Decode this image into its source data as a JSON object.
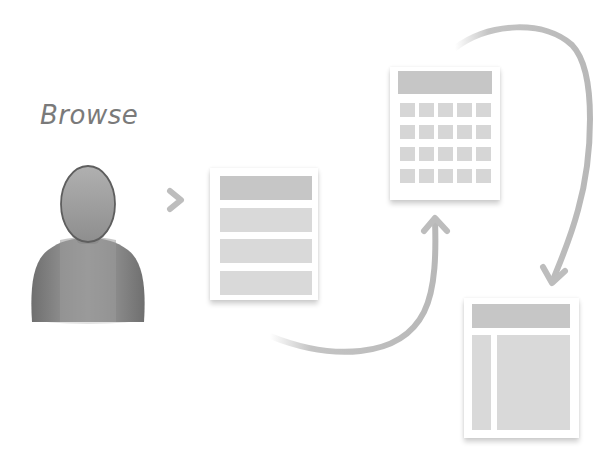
{
  "diagram": {
    "title": "Browse",
    "nodes": [
      {
        "id": "user",
        "type": "person-icon"
      },
      {
        "id": "list-page",
        "type": "list-layout",
        "rows": 4
      },
      {
        "id": "grid-page",
        "type": "grid-layout",
        "rows": 4,
        "columns": 5
      },
      {
        "id": "detail-page",
        "type": "sidebar-content-layout"
      }
    ],
    "edges": [
      {
        "from": "user",
        "to": "list-page",
        "style": "short-arrow"
      },
      {
        "from": "list-page",
        "to": "grid-page",
        "style": "curved-arrow"
      },
      {
        "from": "grid-page",
        "to": "detail-page",
        "style": "curved-arrow"
      }
    ],
    "colors": {
      "text": "#7a7a7a",
      "arrow": "#bdbdbd",
      "block_header": "#c6c6c6",
      "block": "#d9d9d9",
      "person_head": "#9e9e9e",
      "person_body": "#8c8c8c"
    }
  }
}
